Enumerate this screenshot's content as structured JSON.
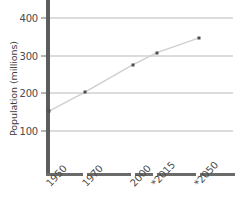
{
  "chart_data": {
    "type": "line",
    "title": "",
    "xlabel": "",
    "ylabel": "Population (millions)",
    "categories": [
      "1950",
      "1970",
      "2000",
      "*2015",
      "*2050"
    ],
    "x": [
      1950,
      1970,
      2000,
      2015,
      2050
    ],
    "values": [
      152,
      203,
      276,
      308,
      347
    ],
    "ylim": [
      0,
      430
    ],
    "yticks": [
      100,
      200,
      300,
      400
    ],
    "ytick_labels": [
      "100",
      "200",
      "300",
      "400"
    ],
    "grid": true,
    "legend": "none",
    "note": "* denotes projected values",
    "series": [
      {
        "name": "Population",
        "values": [
          152,
          203,
          276,
          308,
          347
        ]
      }
    ],
    "colors": {
      "line": "#cfcfcf",
      "marker": "#4e4e4e",
      "gridline": "#b9b9b9",
      "axis": "#5d5d5d",
      "text": "#4a4a4a"
    }
  }
}
